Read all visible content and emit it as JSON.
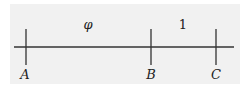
{
  "diagram": {
    "segment_labels": [
      {
        "id": "AB",
        "text": "φ"
      },
      {
        "id": "BC",
        "text": "1"
      }
    ],
    "points": [
      {
        "id": "A",
        "label": "A"
      },
      {
        "id": "B",
        "label": "B"
      },
      {
        "id": "C",
        "label": "C"
      }
    ],
    "colors": {
      "line": "#333333",
      "background": "#f1f1f1"
    }
  }
}
